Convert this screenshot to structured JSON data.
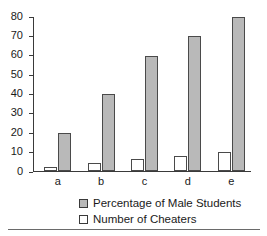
{
  "chart_data": {
    "type": "bar",
    "title": "",
    "xlabel": "",
    "ylabel": "",
    "categories": [
      "a",
      "b",
      "c",
      "d",
      "e"
    ],
    "series": [
      {
        "name": "Number of Cheaters",
        "values": [
          2,
          4,
          6,
          8,
          10
        ],
        "color": "#ffffff"
      },
      {
        "name": "Percentage of Male Students",
        "values": [
          20,
          40,
          60,
          70,
          80
        ],
        "color": "#b9b9b9"
      }
    ],
    "ylim": [
      0,
      80
    ],
    "yticks": [
      0,
      10,
      20,
      30,
      40,
      50,
      60,
      70,
      80
    ],
    "ytick_labels": [
      "0",
      "10",
      "20",
      "30",
      "40",
      "50",
      "60",
      "70",
      "80"
    ],
    "grid": false,
    "legend_position": "below-axis",
    "legend": [
      {
        "label": "Percentage of Male Students",
        "swatch": "gray"
      },
      {
        "label": "Number of Cheaters",
        "swatch": "white"
      }
    ]
  },
  "axis": {
    "ticks": [
      {
        "value": 80,
        "label": "80"
      },
      {
        "value": 70,
        "label": "70"
      },
      {
        "value": 60,
        "label": "60"
      },
      {
        "value": 50,
        "label": "50"
      },
      {
        "value": 40,
        "label": "40"
      },
      {
        "value": 30,
        "label": "30"
      },
      {
        "value": 20,
        "label": "20"
      },
      {
        "value": 10,
        "label": "10"
      },
      {
        "value": 0,
        "label": "0"
      }
    ]
  },
  "groups": [
    {
      "category": "a",
      "cheaters": 2,
      "male": 20
    },
    {
      "category": "b",
      "cheaters": 4,
      "male": 40
    },
    {
      "category": "c",
      "cheaters": 6,
      "male": 60
    },
    {
      "category": "d",
      "cheaters": 8,
      "male": 70
    },
    {
      "category": "e",
      "cheaters": 10,
      "male": 80
    }
  ]
}
